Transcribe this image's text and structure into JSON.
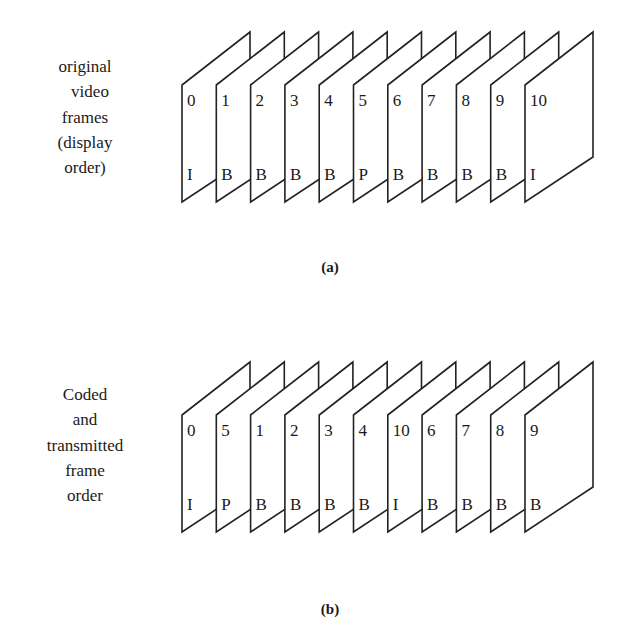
{
  "diagram_a": {
    "label_lines": [
      "original",
      "video",
      "frames",
      "(display",
      "order)"
    ],
    "caption": "(a)",
    "frames": [
      {
        "number": "0",
        "type": "I"
      },
      {
        "number": "1",
        "type": "B"
      },
      {
        "number": "2",
        "type": "B"
      },
      {
        "number": "3",
        "type": "B"
      },
      {
        "number": "4",
        "type": "B"
      },
      {
        "number": "5",
        "type": "P"
      },
      {
        "number": "6",
        "type": "B"
      },
      {
        "number": "7",
        "type": "B"
      },
      {
        "number": "8",
        "type": "B"
      },
      {
        "number": "9",
        "type": "B"
      },
      {
        "number": "10",
        "type": "I"
      }
    ]
  },
  "diagram_b": {
    "label_lines": [
      "Coded",
      "and",
      "transmitted",
      "frame",
      "order"
    ],
    "caption": "(b)",
    "frames": [
      {
        "number": "0",
        "type": "I"
      },
      {
        "number": "5",
        "type": "P"
      },
      {
        "number": "1",
        "type": "B"
      },
      {
        "number": "2",
        "type": "B"
      },
      {
        "number": "3",
        "type": "B"
      },
      {
        "number": "4",
        "type": "B"
      },
      {
        "number": "10",
        "type": "I"
      },
      {
        "number": "6",
        "type": "B"
      },
      {
        "number": "7",
        "type": "B"
      },
      {
        "number": "8",
        "type": "B"
      },
      {
        "number": "9",
        "type": "B"
      }
    ]
  }
}
